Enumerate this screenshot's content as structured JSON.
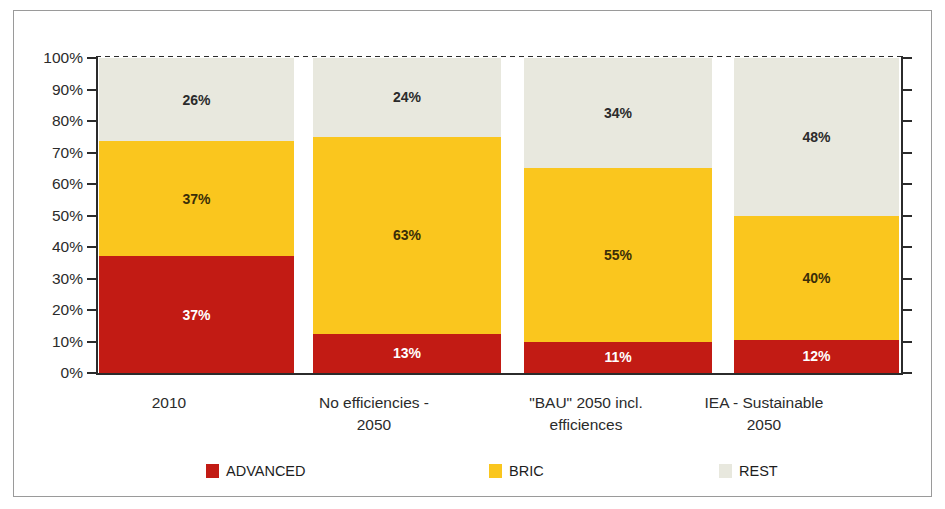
{
  "chart_data": {
    "type": "bar",
    "subtype": "stacked-bar",
    "title": "",
    "xlabel": "",
    "ylabel": "",
    "ylim": [
      0,
      100
    ],
    "grid": false,
    "legend_position": "bottom",
    "y_ticks": [
      "0%",
      "10%",
      "20%",
      "30%",
      "40%",
      "50%",
      "60%",
      "70%",
      "80%",
      "90%",
      "100%"
    ],
    "categories": [
      "2010",
      "No efficiencies - 2050",
      "\"BAU\" 2050 incl. efficiences",
      "IEA - Sustainable 2050"
    ],
    "category_lines": [
      [
        "2010"
      ],
      [
        "No efficiencies -",
        "2050"
      ],
      [
        "\"BAU\" 2050 incl.",
        "efficiences"
      ],
      [
        "IEA - Sustainable",
        "2050"
      ]
    ],
    "series": [
      {
        "name": "ADVANCED",
        "color": "#c21b14",
        "values": [
          37,
          13,
          11,
          12
        ],
        "labels": [
          "37%",
          "13%",
          "11%",
          "12%"
        ],
        "drawn_heights": [
          37,
          12.5,
          10,
          10.5
        ]
      },
      {
        "name": "BRIC",
        "color": "#fac61e",
        "values": [
          37,
          63,
          55,
          40
        ],
        "labels": [
          "37%",
          "63%",
          "55%",
          "40%"
        ],
        "drawn_heights": [
          36.5,
          62.5,
          55,
          39.5
        ]
      },
      {
        "name": "REST",
        "color": "#e8e8de",
        "values": [
          26,
          24,
          34,
          48
        ],
        "labels": [
          "26%",
          "24%",
          "34%",
          "48%"
        ],
        "drawn_heights": [
          26.5,
          25,
          35,
          50
        ]
      }
    ],
    "legend": [
      {
        "label": "ADVANCED",
        "color": "#c21b14"
      },
      {
        "label": "BRIC",
        "color": "#fac61e"
      },
      {
        "label": "REST",
        "color": "#e8e8de"
      }
    ]
  },
  "geometry": {
    "bars": [
      {
        "left": 3,
        "width": 195
      },
      {
        "left": 217,
        "width": 188
      },
      {
        "left": 428,
        "width": 188
      },
      {
        "left": 638,
        "width": 165
      }
    ],
    "cat_label_boxes": [
      {
        "left": 20,
        "width": 270
      },
      {
        "left": 225,
        "width": 270
      },
      {
        "left": 437,
        "width": 270
      },
      {
        "left": 625,
        "width": 250
      }
    ],
    "legend_x": [
      192,
      475,
      705
    ]
  }
}
